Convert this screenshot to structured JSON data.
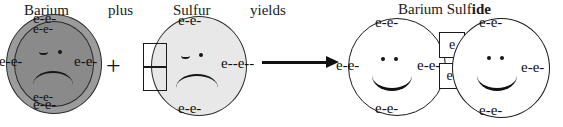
{
  "diagram": {
    "type": "ionic-bond-formation",
    "equation_text": "Barium plus Sulfur yields Barium Sulfide",
    "connectors": {
      "plus_word": "plus",
      "plus_symbol": "+",
      "yields_word": "yields",
      "arrow_icon": "right-arrow-icon"
    },
    "colors": {
      "barium_outer_shell": "#9b9b9b",
      "barium_inner_shell": "#8a8a8a",
      "sulfur_fill": "#e8e8e8",
      "ion_fill": "#ffffff",
      "stroke": "#1a1a1a",
      "background": "#ffffff"
    }
  },
  "reactants": {
    "barium": {
      "label": "Barium",
      "mood": "sad",
      "shells": 2,
      "outer_electrons": {
        "top": "e-e-",
        "left": "e-e-",
        "right": "e-e-",
        "bottom": "e-e-"
      },
      "inner_electrons": {
        "top": "e-e-",
        "left": "e-e-",
        "right": "e-e-",
        "bottom": "e-e-"
      }
    },
    "sulfur": {
      "label": "Sulfur",
      "mood": "sad",
      "electrons": {
        "top": "e-e-",
        "right": "e--e--",
        "bottom": "e-e-"
      },
      "empty_slots": [
        "",
        ""
      ],
      "empty_slot_count": 2
    }
  },
  "products": {
    "title_plain": "Barium Sulf",
    "title_bold": "ide",
    "title_full": "Barium Sulfide",
    "barium_ion": {
      "mood": "happy",
      "electrons": {
        "top": "e-e-",
        "left": "e-e-",
        "right": "e-e-",
        "bottom": "e-e-"
      },
      "lone_pair": ".."
    },
    "sulfide_ion": {
      "mood": "happy",
      "electrons": {
        "top": "e-e-",
        "right": "e-e-",
        "bottom": "e-e-"
      },
      "lone_pair": ".."
    },
    "transferred_electrons": {
      "top_box": "e",
      "bottom_box": "e-",
      "count": 2
    }
  }
}
